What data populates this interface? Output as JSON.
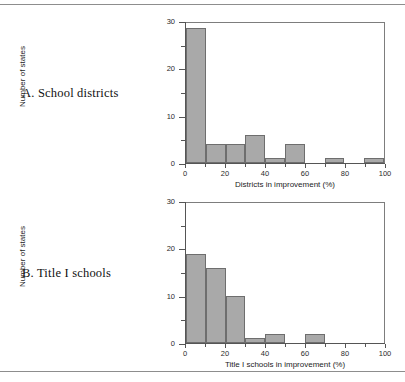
{
  "figure": {
    "panels": [
      {
        "id": "a",
        "label": "A. School districts"
      },
      {
        "id": "b",
        "label": "B. Title I schools"
      }
    ]
  },
  "chart_data": [
    {
      "type": "bar",
      "panel": "A",
      "panel_label": "A. School districts",
      "title": "",
      "xlabel": "Districts in improvement (%)",
      "ylabel": "Number of states",
      "xlim": [
        0,
        100
      ],
      "ylim": [
        0,
        30
      ],
      "xticks": [
        0,
        20,
        40,
        60,
        80,
        100
      ],
      "xticklabels": [
        "0",
        "20",
        "40",
        "60",
        "80",
        "100"
      ],
      "xminorticks": [
        10,
        30,
        50,
        70,
        90
      ],
      "yticks": [
        0,
        10,
        20,
        30
      ],
      "yticklabels": [
        "0",
        "10",
        "20",
        "30"
      ],
      "yminorticks": [
        5,
        15,
        25
      ],
      "grid": false,
      "legend": false,
      "bin_width": 10,
      "categories": [
        "0-10",
        "10-20",
        "20-30",
        "30-40",
        "40-50",
        "50-60",
        "60-70",
        "70-80",
        "80-90",
        "90-100"
      ],
      "values": [
        29,
        4,
        4,
        6,
        1,
        4,
        0,
        1,
        0,
        1
      ],
      "bar_color": "#a9a9a9",
      "bar_edge_color": "#6e6e6e"
    },
    {
      "type": "bar",
      "panel": "B",
      "panel_label": "B. Title I schools",
      "title": "",
      "xlabel": "Title I schools in improvement (%)",
      "ylabel": "Number of states",
      "xlim": [
        0,
        100
      ],
      "ylim": [
        0,
        30
      ],
      "xticks": [
        0,
        20,
        40,
        60,
        80,
        100
      ],
      "xticklabels": [
        "0",
        "20",
        "40",
        "60",
        "80",
        "100"
      ],
      "xminorticks": [
        10,
        30,
        50,
        70,
        90
      ],
      "yticks": [
        0,
        10,
        20,
        30
      ],
      "yticklabels": [
        "0",
        "10",
        "20",
        "30"
      ],
      "yminorticks": [
        5,
        15,
        25
      ],
      "grid": false,
      "legend": false,
      "bin_width": 10,
      "categories": [
        "0-10",
        "10-20",
        "20-30",
        "30-40",
        "40-50",
        "50-60",
        "60-70",
        "70-80",
        "80-90",
        "90-100"
      ],
      "values": [
        19,
        16,
        10,
        1,
        2,
        0,
        2,
        0,
        0,
        0
      ],
      "bar_color": "#a9a9a9",
      "bar_edge_color": "#6e6e6e"
    }
  ]
}
